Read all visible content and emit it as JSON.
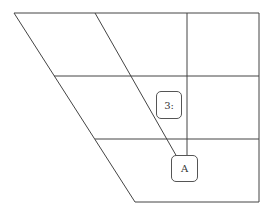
{
  "diagram": {
    "line_color": "#444444",
    "nodes": [
      {
        "id": "node-3",
        "label": "3:"
      },
      {
        "id": "node-a",
        "label": "A"
      }
    ]
  }
}
